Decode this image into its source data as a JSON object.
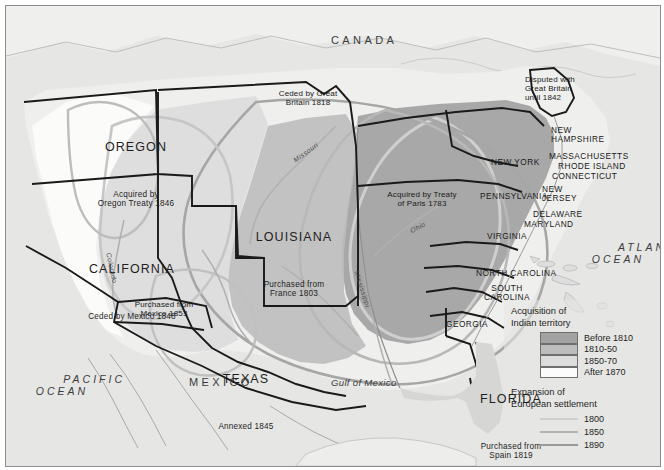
{
  "map": {
    "regions": [
      {
        "name": "OREGON",
        "sub": "Acquired by\nOregon Treaty 1846",
        "x": 70,
        "y": 100,
        "w": 120
      },
      {
        "name": "CALIFORNIA",
        "sub": "Ceded by Mexico 1848",
        "x": 62,
        "y": 222,
        "w": 128
      },
      {
        "name": "LOUISIANA",
        "sub": "Purchased from\nFrance 1803",
        "x": 233,
        "y": 192,
        "w": 110
      },
      {
        "name": "TEXAS",
        "sub": "Annexed 1845",
        "x": 196,
        "y": 335,
        "w": 86
      },
      {
        "name": "FLORIDA",
        "sub": "Purchased from\nSpain 1819",
        "x": 462,
        "y": 354,
        "w": 88
      }
    ],
    "notes": [
      {
        "text": "Ceded by Great\nBritain 1818",
        "x": 262,
        "y": 87,
        "w": 78
      },
      {
        "text": "Disputed with\nGreat Britain\nuntil 1842",
        "x": 522,
        "y": 73,
        "w": 70
      },
      {
        "text": "Acquired by Treaty\nof Paris 1783",
        "x": 369,
        "y": 188,
        "w": 92
      },
      {
        "text": "Purchased from\nMexico 1853",
        "x": 118,
        "y": 298,
        "w": 80
      }
    ],
    "states": [
      {
        "label": "NEW YORK",
        "x": 488,
        "y": 155,
        "w": 62
      },
      {
        "label": "NEW\nHAMPSHIRE",
        "x": 548,
        "y": 124,
        "w": 60
      },
      {
        "label": "MASSACHUSETTS",
        "x": 545,
        "y": 149,
        "w": 86
      },
      {
        "label": "RHODE ISLAND",
        "x": 555,
        "y": 159,
        "w": 80
      },
      {
        "label": "CONNECTICUT",
        "x": 549,
        "y": 169,
        "w": 78
      },
      {
        "label": "PENNSYLVANIA",
        "x": 477,
        "y": 188,
        "w": 80
      },
      {
        "label": "NEW\nJERSEY",
        "x": 538,
        "y": 182,
        "w": 40
      },
      {
        "label": "DELAWARE",
        "x": 530,
        "y": 207,
        "w": 56
      },
      {
        "label": "MARYLAND",
        "x": 521,
        "y": 217,
        "w": 56
      },
      {
        "label": "VIRGINIA",
        "x": 484,
        "y": 228,
        "w": 48
      },
      {
        "label": "NORTH CAROLINA",
        "x": 474,
        "y": 266,
        "w": 90
      },
      {
        "label": "SOUTH\nCAROLINA",
        "x": 478,
        "y": 281,
        "w": 52
      },
      {
        "label": "GEORGIA",
        "x": 443,
        "y": 317,
        "w": 50
      }
    ],
    "countries": [
      {
        "label": "CANADA",
        "x": 330,
        "y": 35
      },
      {
        "label": "MEXICO",
        "x": 185,
        "y": 378
      },
      {
        "label": "PACIFIC\nOCEAN",
        "x": 12,
        "y": 363
      },
      {
        "label": "ATLANTIC\nOCEAN",
        "x": 573,
        "y": 228
      }
    ],
    "water": {
      "gulf": "Gulf of Mexico",
      "gulf_x": 330,
      "gulf_y": 377
    },
    "rivers": [
      {
        "label": "Missouri",
        "x": 290,
        "y": 155,
        "rot": -36
      },
      {
        "label": "Mississippi",
        "x": 356,
        "y": 272,
        "rot": 72
      },
      {
        "label": "Ohio",
        "x": 405,
        "y": 224,
        "rot": -28
      },
      {
        "label": "Colorado",
        "x": 108,
        "y": 252,
        "rot": 78
      }
    ]
  },
  "legend": {
    "heading1": "Acquisition of\nIndian territory",
    "swatches": [
      {
        "label": "Before 1810",
        "color": "#a2a2a2"
      },
      {
        "label": "1810-50",
        "color": "#bdbdbd"
      },
      {
        "label": "1850-70",
        "color": "#dcdcdc"
      },
      {
        "label": "After 1870",
        "color": "#fbfbfb"
      }
    ],
    "heading2": "Expansion of\nEuropean settlement",
    "lines": [
      {
        "label": "1800",
        "color": "#cfcfcf"
      },
      {
        "label": "1850",
        "color": "#b3b3b3"
      },
      {
        "label": "1890",
        "color": "#9a9a9a"
      }
    ]
  },
  "colors": {
    "sea": "#e6e6e4",
    "land_light": "#efefed",
    "tone_dark": "#a2a2a2",
    "tone_mid": "#bdbdbd",
    "tone_light": "#dcdcdc",
    "border": "#1a1a1a"
  }
}
